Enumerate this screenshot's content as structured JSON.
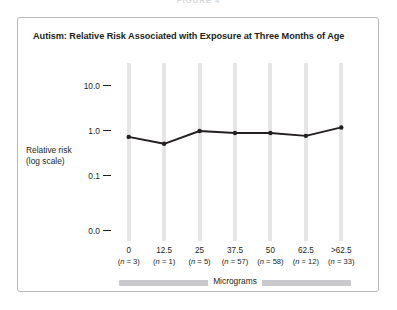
{
  "figure": {
    "caption": "FIGURE 4"
  },
  "chart": {
    "title": "Autism: Relative Risk Associated with Exposure at Three Months of Age",
    "y_axis_label_line1": "Relative risk",
    "y_axis_label_line2": "(log scale)",
    "x_axis_title": "Micrograms",
    "colors": {
      "line": "#231f20",
      "gridline": "#e6e6e8",
      "panel_border": "#b9b9bd",
      "axis_bar": "#c9c9cd",
      "text": "#231f20"
    }
  },
  "chart_data": {
    "type": "line",
    "title": "Autism: Relative Risk Associated with Exposure at Three Months of Age",
    "xlabel": "Micrograms",
    "ylabel": "Relative risk (log scale)",
    "yscale": "log",
    "ytick_labels": [
      "10.0",
      "1.0",
      "0.1",
      "0.0"
    ],
    "ytick_values": [
      10.0,
      1.0,
      0.1,
      0.0
    ],
    "ylim": [
      0.0,
      10.0
    ],
    "grid": "vertical-stripes",
    "legend": "none",
    "categories": [
      "0",
      "12.5",
      "25",
      "37.5",
      "50",
      "62.5",
      ">62.5"
    ],
    "category_n": [
      3,
      1,
      5,
      57,
      58,
      12,
      33
    ],
    "category_n_labels": [
      "(n = 3)",
      "(n = 1)",
      "(n = 5)",
      "(n = 57)",
      "(n = 58)",
      "(n = 12)",
      "(n = 33)"
    ],
    "values": [
      0.74,
      0.52,
      1.0,
      0.9,
      0.9,
      0.78,
      1.2
    ],
    "series": [
      {
        "name": "Relative risk",
        "values": [
          0.74,
          0.52,
          1.0,
          0.9,
          0.9,
          0.78,
          1.2
        ]
      }
    ],
    "marker": "circle",
    "marker_color": "#231f20",
    "line_color": "#231f20"
  }
}
